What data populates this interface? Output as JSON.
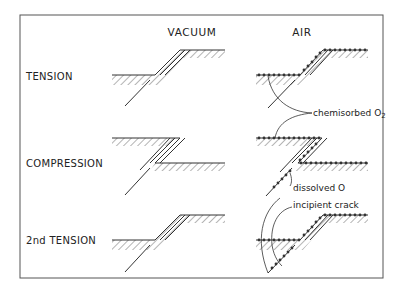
{
  "figure": {
    "columns": [
      {
        "id": "vacuum",
        "label": "VACUUM"
      },
      {
        "id": "air",
        "label": "AIR"
      }
    ],
    "rows": [
      {
        "id": "tension",
        "label": "TENSION"
      },
      {
        "id": "compression",
        "label": "COMPRESSION"
      },
      {
        "id": "second-tension",
        "label": "2nd TENSION"
      }
    ],
    "annotations": {
      "chemisorbed": "chemisorbed O",
      "chemisorbed_sub": "2",
      "dissolved": "dissolved O",
      "incipient_crack": "incipient crack"
    },
    "colors": {
      "line": "#333333",
      "background": "#ffffff"
    }
  }
}
